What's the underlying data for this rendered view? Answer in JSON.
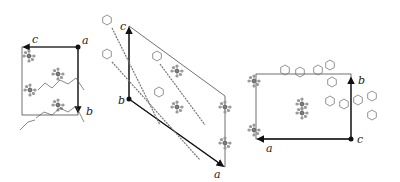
{
  "figure": {
    "panels": [
      {
        "id": "left",
        "description": "Crystal packing viewed along a",
        "axes": [
          {
            "label": "a",
            "type": "origin-dot"
          },
          {
            "label": "c",
            "direction": "left"
          },
          {
            "label": "b",
            "direction": "down"
          }
        ]
      },
      {
        "id": "middle",
        "description": "Crystal packing viewed along b",
        "axes": [
          {
            "label": "b",
            "type": "origin-dot"
          },
          {
            "label": "c",
            "direction": "up"
          },
          {
            "label": "a",
            "direction": "down-right"
          }
        ]
      },
      {
        "id": "right",
        "description": "Crystal packing viewed along c",
        "axes": [
          {
            "label": "c",
            "type": "origin-dot"
          },
          {
            "label": "b",
            "direction": "up"
          },
          {
            "label": "a",
            "direction": "left"
          }
        ]
      }
    ],
    "colors": {
      "axis": "#111111",
      "cell": "#333333",
      "molecule": "#555555",
      "anion": "#888888"
    }
  }
}
